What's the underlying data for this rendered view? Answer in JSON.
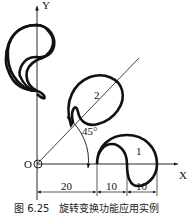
{
  "figure": {
    "axis_x_label": "X",
    "axis_y_label": "Y",
    "origin_label": "O",
    "angle_label": "45°",
    "shape_labels": [
      "1",
      "2"
    ],
    "dimensions": [
      "20",
      "10",
      "10"
    ],
    "caption": "图 6.25　旋转变换功能应用实例"
  }
}
